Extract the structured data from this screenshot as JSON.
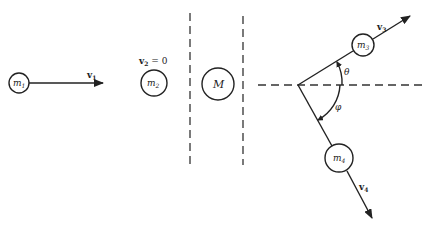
{
  "diagram": {
    "particles": {
      "m1": {
        "label": "m",
        "sub": "1"
      },
      "m2": {
        "label": "m",
        "sub": "2"
      },
      "M": {
        "label": "M"
      },
      "m3": {
        "label": "m",
        "sub": "3"
      },
      "m4": {
        "label": "m",
        "sub": "4"
      }
    },
    "velocities": {
      "v1": {
        "label": "v",
        "sub": "1"
      },
      "v2": {
        "label": "v",
        "sub": "2",
        "suffix": " = 0"
      },
      "v3": {
        "label": "v",
        "sub": "3"
      },
      "v4": {
        "label": "v",
        "sub": "4"
      }
    },
    "angles": {
      "theta": "θ",
      "phi": "φ"
    }
  }
}
